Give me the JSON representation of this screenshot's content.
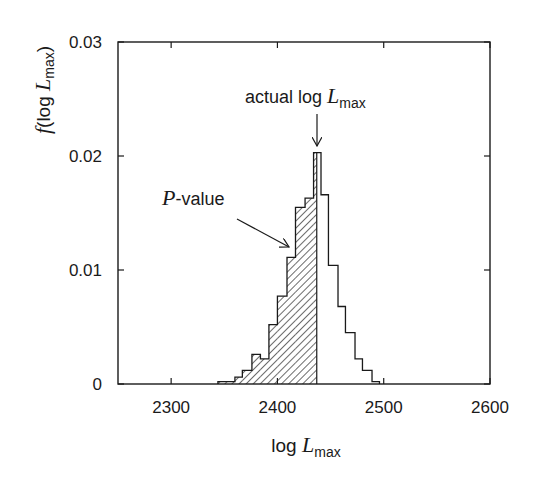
{
  "chart_data": {
    "type": "bar",
    "subtype": "histogram",
    "title": "",
    "xlabel": "log L_max",
    "ylabel": "f(log L_max)",
    "xlim": [
      2250,
      2600
    ],
    "ylim": [
      0,
      0.03
    ],
    "xticks": [
      2300,
      2400,
      2500,
      2600
    ],
    "xtick_labels": [
      "2300",
      "2400",
      "2500",
      "2600"
    ],
    "yticks": [
      0,
      0.01,
      0.02,
      0.03
    ],
    "ytick_labels": [
      "0",
      "0.01",
      "0.02",
      "0.03"
    ],
    "grid": false,
    "legend": null,
    "actual_value": 2437,
    "bins": [
      {
        "x0": 2344,
        "x1": 2352,
        "y": 0.0002
      },
      {
        "x0": 2352,
        "x1": 2360,
        "y": 0.0002
      },
      {
        "x0": 2360,
        "x1": 2367,
        "y": 0.0006
      },
      {
        "x0": 2367,
        "x1": 2376,
        "y": 0.0012
      },
      {
        "x0": 2376,
        "x1": 2384,
        "y": 0.0026
      },
      {
        "x0": 2384,
        "x1": 2392,
        "y": 0.0022
      },
      {
        "x0": 2392,
        "x1": 2400,
        "y": 0.0052
      },
      {
        "x0": 2400,
        "x1": 2409,
        "y": 0.0077
      },
      {
        "x0": 2409,
        "x1": 2417,
        "y": 0.0111
      },
      {
        "x0": 2417,
        "x1": 2426,
        "y": 0.0155
      },
      {
        "x0": 2426,
        "x1": 2434,
        "y": 0.0163
      },
      {
        "x0": 2434,
        "x1": 2441,
        "y": 0.0203
      },
      {
        "x0": 2441,
        "x1": 2448,
        "y": 0.0166
      },
      {
        "x0": 2448,
        "x1": 2457,
        "y": 0.0104
      },
      {
        "x0": 2457,
        "x1": 2464,
        "y": 0.0068
      },
      {
        "x0": 2464,
        "x1": 2473,
        "y": 0.0045
      },
      {
        "x0": 2473,
        "x1": 2480,
        "y": 0.0022
      },
      {
        "x0": 2480,
        "x1": 2489,
        "y": 0.0012
      },
      {
        "x0": 2489,
        "x1": 2496,
        "y": 0.0002
      }
    ],
    "shaded_region": {
      "from": 2344,
      "to": 2437,
      "pattern": "diagonal-hatch",
      "meaning": "P-value"
    },
    "annotations": [
      {
        "text": "actual log L_max",
        "arrow_to_x": 2437,
        "arrow_to_y": 0.0205
      },
      {
        "text": "P-value",
        "arrow_to_x": 2414,
        "arrow_to_y": 0.012
      }
    ]
  },
  "labels": {
    "y_axis_prefix": "f",
    "y_axis_mid": "(log ",
    "y_axis_L": "L",
    "y_axis_sub": "max",
    "y_axis_suffix": ")",
    "x_axis_log": "log ",
    "x_axis_L": "L",
    "x_axis_sub": "max",
    "actual_prefix": "actual log ",
    "actual_L": "L",
    "actual_sub": "max",
    "pvalue_P": "P",
    "pvalue_rest": "-value"
  },
  "style": {
    "line_color": "#1a1a1a",
    "background": "#ffffff"
  }
}
